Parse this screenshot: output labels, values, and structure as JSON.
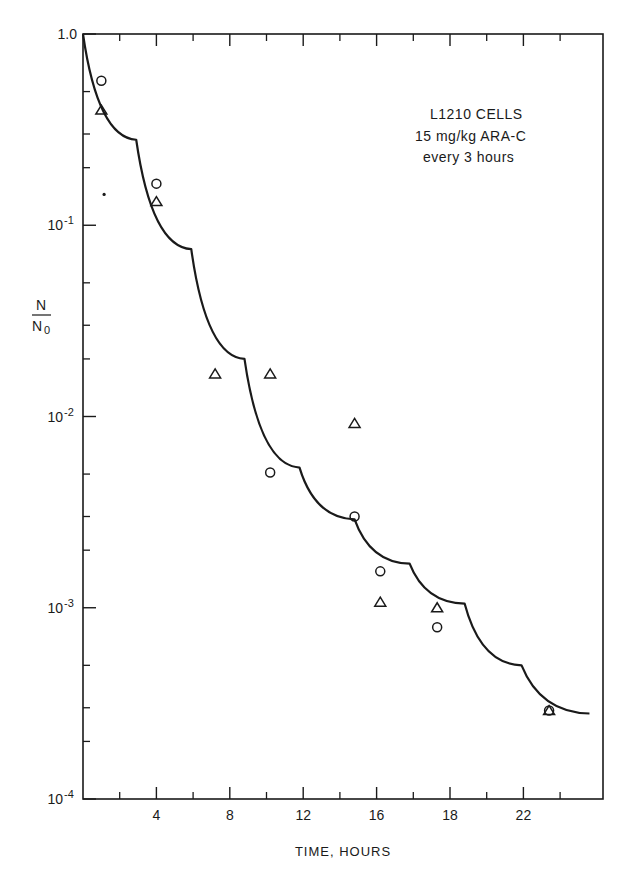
{
  "chart_data": {
    "type": "scatter",
    "title": "",
    "annotation": [
      "L1210 CELLS",
      "15 mg/kg ARA-C",
      "every 3 hours"
    ],
    "xlabel": "TIME, HOURS",
    "ylabel": {
      "numerator": "N",
      "denominator": "N",
      "denominator_subscript": "0"
    },
    "yscale": "log",
    "ylim": [
      0.0001,
      1.0
    ],
    "xlim": [
      0,
      28.4
    ],
    "grid": false,
    "legend": null,
    "x_tick_labels": [
      "4",
      "8",
      "12",
      "16",
      "18",
      "22"
    ],
    "x_tick_positions_hours": [
      4,
      8,
      12,
      16,
      20,
      24
    ],
    "x_minor_tick_positions_hours": [
      2,
      6,
      10,
      14,
      18,
      22,
      26
    ],
    "y_tick_labels": [
      {
        "mantissa": "1.0",
        "exp": ""
      },
      {
        "mantissa": "10",
        "exp": "-1"
      },
      {
        "mantissa": "10",
        "exp": "-2"
      },
      {
        "mantissa": "10",
        "exp": "-3"
      },
      {
        "mantissa": "10",
        "exp": "-4"
      }
    ],
    "y_tick_values": [
      1.0,
      0.1,
      0.01,
      0.001,
      0.0001
    ],
    "y_minor_multipliers": [
      2,
      3,
      5
    ],
    "series": [
      {
        "name": "circles",
        "marker": "circle",
        "x": [
          1.0,
          4.0,
          10.2,
          14.8,
          16.2,
          19.3,
          25.4
        ],
        "y": [
          0.57,
          0.165,
          0.0051,
          0.003,
          0.00155,
          0.00079,
          0.00029
        ]
      },
      {
        "name": "triangles",
        "marker": "triangle",
        "x": [
          1.0,
          4.0,
          7.2,
          10.2,
          14.8,
          16.2,
          19.3,
          25.4
        ],
        "y": [
          0.4,
          0.133,
          0.0167,
          0.0167,
          0.0092,
          0.00107,
          0.001,
          0.00029
        ]
      },
      {
        "name": "curve",
        "marker": "line",
        "note": "model curve; concave-up segments with kinks at each 3-hour dose",
        "x": [
          0.0,
          2.9,
          5.9,
          8.8,
          11.8,
          14.8,
          17.8,
          20.8,
          23.9,
          27.6
        ],
        "y": [
          1.0,
          0.28,
          0.075,
          0.02,
          0.0054,
          0.0029,
          0.0017,
          0.00105,
          0.0005,
          0.00028
        ]
      }
    ],
    "stray_mark": {
      "x": 1.15,
      "y": 0.145
    }
  }
}
